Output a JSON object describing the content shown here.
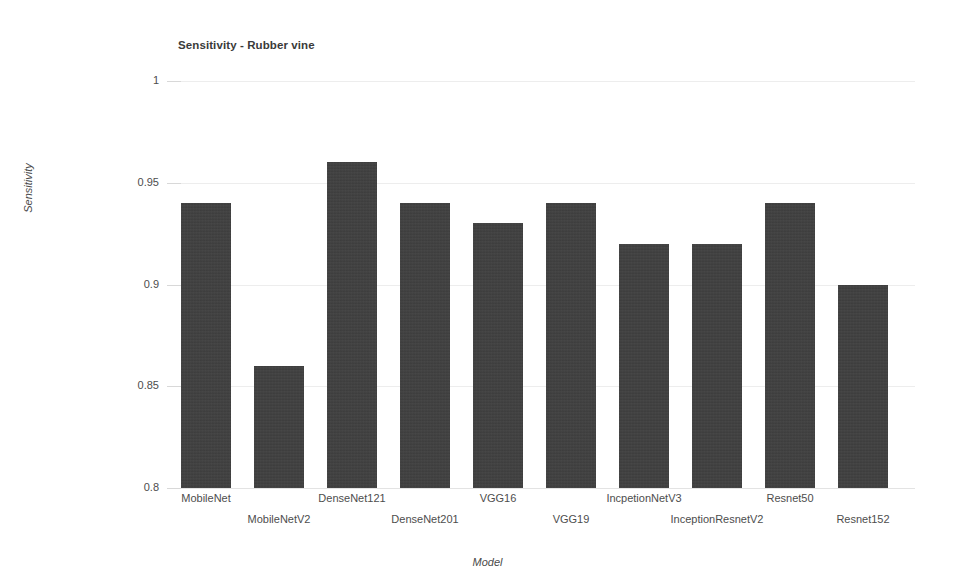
{
  "chart_data": {
    "type": "bar",
    "title": "Sensitivity - Rubber vine",
    "xlabel": "Model",
    "ylabel": "Sensitivity",
    "ylim": [
      0.8,
      1
    ],
    "yticks": [
      "0.8",
      "0.85",
      "0.9",
      "0.95",
      "1"
    ],
    "ytick_values": [
      0.8,
      0.85,
      0.9,
      0.95,
      1
    ],
    "grid": true,
    "legend": null,
    "legend_position": "none",
    "bar_color": "#3f3f3f",
    "categories": [
      "MobileNet",
      "MobileNetV2",
      "DenseNet121",
      "DenseNet201",
      "VGG16",
      "VGG19",
      "IncpetionNetV3",
      "InceptionResnetV2",
      "Resnet50",
      "Resnet152"
    ],
    "values": [
      0.94,
      0.86,
      0.96,
      0.94,
      0.93,
      0.94,
      0.92,
      0.92,
      0.94,
      0.9
    ]
  }
}
